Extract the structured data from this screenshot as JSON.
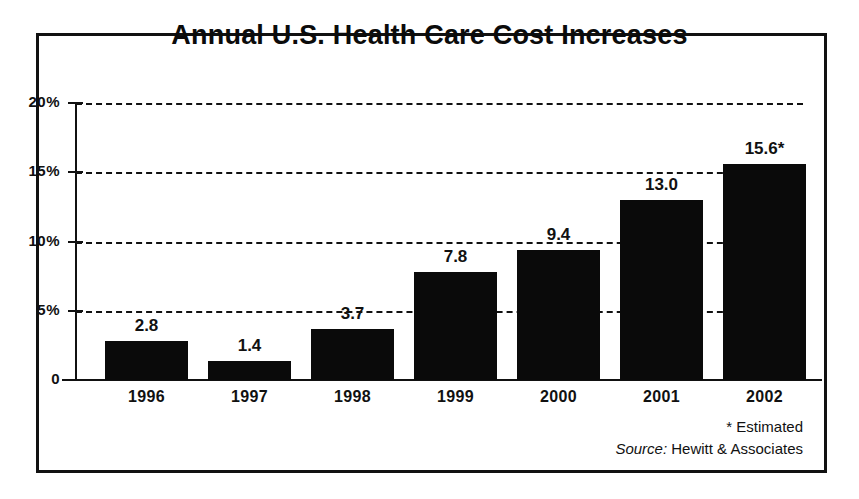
{
  "chart_data": {
    "type": "bar",
    "title": "Annual U.S. Health Care Cost Increases",
    "xlabel": "",
    "ylabel": "",
    "categories": [
      "1996",
      "1997",
      "1998",
      "1999",
      "2000",
      "2001",
      "2002"
    ],
    "values": [
      2.8,
      1.4,
      3.7,
      7.8,
      9.4,
      13.0,
      15.6
    ],
    "value_labels": [
      "2.8",
      "1.4",
      "3.7",
      "7.8",
      "9.4",
      "13.0",
      "15.6*"
    ],
    "ylim": [
      0,
      20
    ],
    "ytick_values": [
      0,
      5,
      10,
      15,
      20
    ],
    "ytick_labels": [
      "0",
      "5%",
      "10%",
      "15%",
      "20%"
    ],
    "grid": true,
    "grid_style": "dashed-horizontal",
    "legend": false,
    "bar_color": "#0a0a0a",
    "footnote": "* Estimated",
    "source_label": "Source:",
    "source_value": "Hewitt & Associates"
  },
  "notes": {
    "estimated": "* Estimated",
    "source_prefix": "Source:",
    "source_name": "Hewitt & Associates"
  }
}
